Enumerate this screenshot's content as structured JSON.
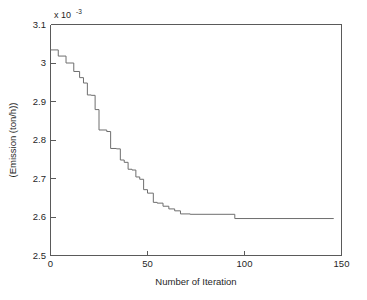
{
  "chart_data": {
    "type": "line",
    "title": "",
    "xlabel": "Number of Iteration",
    "ylabel": "(Emission (ton/h))",
    "y_exponent_label": "x 10",
    "y_exponent_power": "-3",
    "xlim": [
      0,
      150
    ],
    "ylim": [
      2.5,
      3.1
    ],
    "xticks": [
      0,
      50,
      100,
      150
    ],
    "xticklabels": [
      "0",
      "50",
      "100",
      "150"
    ],
    "yticks": [
      2.5,
      2.6,
      2.7,
      2.8,
      2.9,
      3.0,
      3.1
    ],
    "yticklabels": [
      "2.5",
      "2.6",
      "2.7",
      "2.8",
      "2.9",
      "3",
      "3.1"
    ],
    "grid": false,
    "legend": null,
    "series": [
      {
        "name": "Emission convergence",
        "color": "#6e6e6e",
        "step": "post",
        "x": [
          0,
          4,
          4,
          8,
          8,
          12,
          12,
          15,
          15,
          17,
          17,
          19,
          19,
          21,
          21,
          23,
          23,
          25,
          25,
          29,
          29,
          31,
          31,
          34,
          34,
          36,
          36,
          38,
          38,
          40,
          40,
          42,
          42,
          44,
          44,
          46,
          46,
          48,
          48,
          50,
          50,
          53,
          53,
          55,
          55,
          58,
          58,
          61,
          61,
          64,
          64,
          67,
          67,
          72,
          72,
          95,
          95,
          146
        ],
        "y": [
          3.034,
          3.034,
          3.018,
          3.018,
          3.0,
          3.0,
          2.978,
          2.978,
          2.962,
          2.962,
          2.948,
          2.948,
          2.917,
          2.917,
          2.916,
          2.916,
          2.879,
          2.879,
          2.826,
          2.826,
          2.822,
          2.822,
          2.778,
          2.778,
          2.777,
          2.777,
          2.748,
          2.748,
          2.742,
          2.742,
          2.724,
          2.724,
          2.722,
          2.722,
          2.704,
          2.704,
          2.698,
          2.698,
          2.671,
          2.671,
          2.662,
          2.662,
          2.638,
          2.638,
          2.636,
          2.636,
          2.628,
          2.628,
          2.621,
          2.621,
          2.616,
          2.616,
          2.608,
          2.608,
          2.607,
          2.607,
          2.596,
          2.596
        ]
      }
    ]
  },
  "figure": {
    "background_color": "#ffffff",
    "axis_color": "#5a5a5a",
    "line_color": "#6e6e6e"
  }
}
